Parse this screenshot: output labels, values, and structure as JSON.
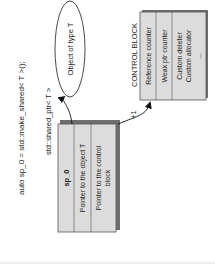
{
  "diagram": {
    "code_line": "auto sp_0 = std::make_shared< T >();",
    "shared_ptr_type": "std::shared_ptr< T >",
    "shared_ptr_box": {
      "name": "sp_0",
      "rows": [
        "Pointer to the object T",
        "Pointer to the control",
        "block"
      ]
    },
    "object": {
      "label": "Object of type T"
    },
    "control_block": {
      "title": "CONTROL BLOCK",
      "rows": [
        "Reference counter",
        "Weak ptr counter",
        "Custom deleter",
        "Custom allocator",
        "..."
      ]
    },
    "increment_label": "+1",
    "colors": {
      "box_fill": "#dcdcdc",
      "header_fill": "#cfcfcf",
      "shadow": "#6e6e6e",
      "stroke": "#555555"
    }
  }
}
